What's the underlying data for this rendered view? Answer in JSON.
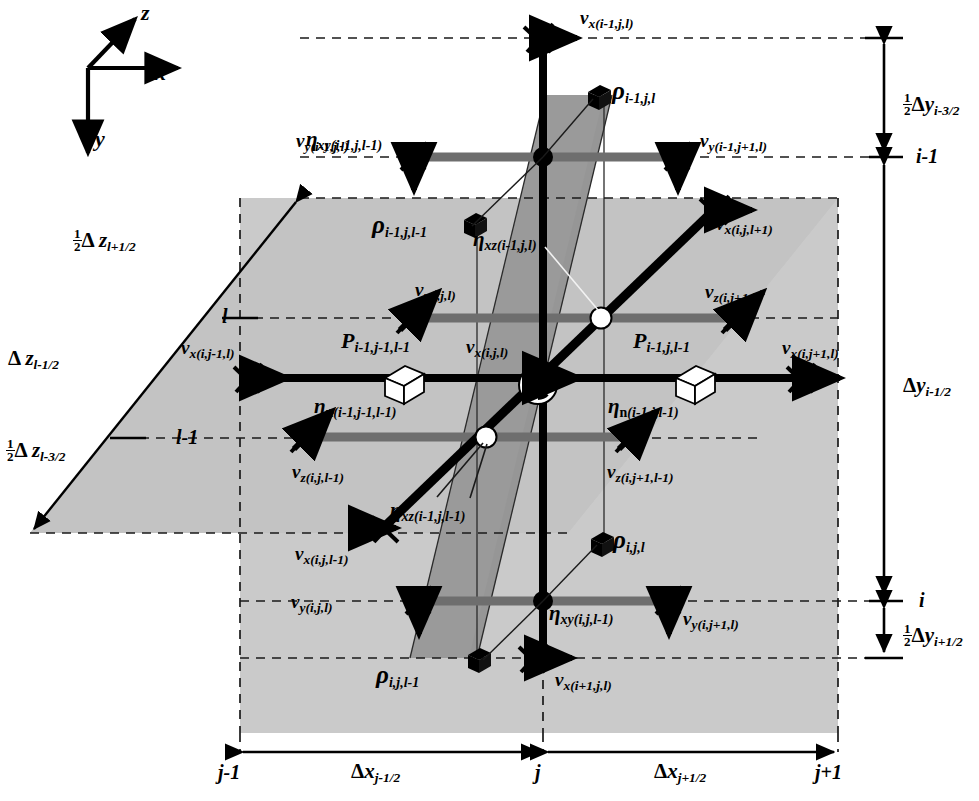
{
  "figure": {
    "kind": "staggered-grid-finite-difference-stencil",
    "colors": {
      "ink": "#000000",
      "plane_light": "#c3c3c3",
      "plane_dark": "#9a9a9a",
      "bar_gray": "#6e6e6e",
      "background": "#ffffff"
    }
  },
  "axes": {
    "z_label": "z",
    "x_label": "x",
    "y_label": "y"
  },
  "velocity_labels": [
    {
      "name": "vx-im1-j-l",
      "base": "v",
      "comp": "x",
      "idx": "(i-1,j,l)",
      "x": 580,
      "y": 8,
      "marker": "cross-arrow-right",
      "mx": 537,
      "my": 38
    },
    {
      "name": "vy-im1-j-l",
      "base": "v",
      "comp": "y",
      "idx": "(i-1,j,l)",
      "x": 296,
      "y": 131,
      "marker": "cross-arrow-down",
      "mx": 413,
      "my": 157
    },
    {
      "name": "vy-im1-jp1-l",
      "base": "v",
      "comp": "y",
      "idx": "(i-1,j+1,l)",
      "x": 700,
      "y": 131,
      "marker": "cross-arrow-down",
      "mx": 678,
      "my": 157
    },
    {
      "name": "vx-i-j-lp1",
      "base": "v",
      "comp": "x",
      "idx": "(i,j,l+1)",
      "x": 716,
      "y": 214,
      "marker": "cross-arrow-right",
      "mx": 713,
      "my": 209
    },
    {
      "name": "vz-i-j-l",
      "base": "v",
      "comp": "z",
      "idx": "(i,j,l)",
      "x": 415,
      "y": 280,
      "marker": "cross-arrow-ne",
      "mx": 409,
      "my": 320
    },
    {
      "name": "vz-i-jp1-l",
      "base": "v",
      "comp": "z",
      "idx": "(i,j+1,l)",
      "x": 705,
      "y": 282,
      "marker": "cross-arrow-ne",
      "mx": 734,
      "my": 319
    },
    {
      "name": "vx-i-jm1-l",
      "base": "v",
      "comp": "x",
      "idx": "(i,j-1,l)",
      "x": 181,
      "y": 338,
      "marker": "cross-arrow-right",
      "mx": 247,
      "my": 378
    },
    {
      "name": "vx-i-j-l",
      "base": "v",
      "comp": "x",
      "idx": "(i,j,l)",
      "x": 466,
      "y": 337,
      "marker": "center-pie",
      "mx": 538,
      "my": 385
    },
    {
      "name": "vx-i-jp1-l",
      "base": "v",
      "comp": "x",
      "idx": "(i,j+1,l)",
      "x": 782,
      "y": 338,
      "marker": "cross-arrow-right",
      "mx": 800,
      "my": 378
    },
    {
      "name": "vz-i-j-lm1",
      "base": "v",
      "comp": "z",
      "idx": "(i,j,l-1)",
      "x": 292,
      "y": 462,
      "marker": "cross-arrow-ne",
      "mx": 303,
      "my": 436
    },
    {
      "name": "vz-i-jp1-lm1",
      "base": "v",
      "comp": "z",
      "idx": "(i,j+1,l-1)",
      "x": 607,
      "y": 462,
      "marker": "cross-arrow-ne",
      "mx": 628,
      "my": 436
    },
    {
      "name": "vx-i-j-lm1",
      "base": "v",
      "comp": "x",
      "idx": "(i,j,l-1)",
      "x": 295,
      "y": 544,
      "marker": "cross-arrow-right",
      "mx": 383,
      "my": 528
    },
    {
      "name": "vy-i-j-l",
      "base": "v",
      "comp": "y",
      "idx": "(i,j,l)",
      "x": 291,
      "y": 592,
      "marker": "cross-arrow-down",
      "mx": 419,
      "my": 601
    },
    {
      "name": "vy-i-jp1-l",
      "base": "v",
      "comp": "y",
      "idx": "(i,j+1,l)",
      "x": 683,
      "y": 609,
      "marker": "cross-arrow-down",
      "mx": 669,
      "my": 601
    },
    {
      "name": "vx-ip1-j-l",
      "base": "v",
      "comp": "x",
      "idx": "(i+1,j,l)",
      "x": 555,
      "y": 670,
      "marker": "cross-arrow-right",
      "mx": 534,
      "my": 658
    }
  ],
  "eta_labels": [
    {
      "name": "eta-xy-im1-j-lm1",
      "base": "η",
      "comp": "xy",
      "idx": "(i-1,j,l-1)",
      "x": 306,
      "y": 129
    },
    {
      "name": "eta-xz-im1-j-l",
      "base": "η",
      "comp": "xz",
      "idx": "(i-1,j,l)",
      "x": 473,
      "y": 229
    },
    {
      "name": "eta-n-im1-jm1-lm1",
      "base": "η",
      "comp": "n",
      "idx": "(i-1,j-1,l-1)",
      "x": 314,
      "y": 396
    },
    {
      "name": "eta-n-im1-j-lm1",
      "base": "η",
      "comp": "n",
      "idx": "(i-1,j,l-1)",
      "x": 608,
      "y": 396
    },
    {
      "name": "eta-xz-im1-j-lm1",
      "base": "η",
      "comp": "xz",
      "idx": "(i-1,j,l-1)",
      "x": 390,
      "y": 500
    },
    {
      "name": "eta-xy-i-j-lm1",
      "base": "η",
      "comp": "xy",
      "idx": "(i,j,l-1)",
      "x": 549,
      "y": 603
    }
  ],
  "rho_labels": [
    {
      "name": "rho-im1-j-l",
      "base": "ρ",
      "idx": "i-1,j,l",
      "x": 612,
      "y": 78,
      "cube_x": 597,
      "cube_y": 95
    },
    {
      "name": "rho-im1-j-lm1",
      "base": "ρ",
      "idx": "i-1,j,l-1",
      "x": 372,
      "y": 212,
      "cube_x": 473,
      "cube_y": 223
    },
    {
      "name": "rho-i-j-l",
      "base": "ρ",
      "idx": "i,j,l",
      "x": 613,
      "y": 527,
      "cube_x": 600,
      "cube_y": 542
    },
    {
      "name": "rho-i-j-lm1",
      "base": "ρ",
      "idx": "i,j,l-1",
      "x": 376,
      "y": 662,
      "cube_x": 477,
      "cube_y": 658
    }
  ],
  "pressure_labels": [
    {
      "name": "P-im1-jm1-lm1",
      "base": "P",
      "idx": "i-1,j-1,l-1",
      "x": 341,
      "y": 330,
      "cube_x": 398,
      "cube_y": 375
    },
    {
      "name": "P-im1-j-lm1",
      "base": "P",
      "idx": "i-1,j,l-1",
      "x": 633,
      "y": 330,
      "cube_x": 689,
      "cube_y": 375
    }
  ],
  "z_dimension_labels": [
    {
      "name": "half-dz-lp1h",
      "frac": true,
      "num": "1",
      "den": "2",
      "delta": "Δ",
      "base": "z",
      "idx": "l+1/2",
      "x": 73,
      "y": 228
    },
    {
      "name": "dz-lm1h",
      "frac": false,
      "delta": "Δ",
      "base": "z",
      "idx": "l-1/2",
      "x": 8,
      "y": 348
    },
    {
      "name": "half-dz-lm3h",
      "frac": true,
      "num": "1",
      "den": "2",
      "delta": "Δ",
      "base": "z",
      "idx": "l-3/2",
      "x": 6,
      "y": 438
    }
  ],
  "y_dimension_labels": [
    {
      "name": "half-dy-im3h",
      "frac": true,
      "num": "1",
      "den": "2",
      "delta": "Δ",
      "base": "y",
      "idx": "i-3/2",
      "x": 903,
      "y": 92
    },
    {
      "name": "dy-im1h",
      "frac": false,
      "delta": "Δ",
      "base": "y",
      "idx": "i-1/2",
      "x": 903,
      "y": 375
    },
    {
      "name": "half-dy-ip1h",
      "frac": true,
      "num": "1",
      "den": "2",
      "delta": "Δ",
      "base": "y",
      "idx": "i+1/2",
      "x": 903,
      "y": 623
    }
  ],
  "x_dimension_labels": [
    {
      "name": "dx-jm1h",
      "delta": "Δ",
      "base": "x",
      "idx": "j-1/2",
      "x": 351,
      "y": 761
    },
    {
      "name": "dx-jp1h",
      "delta": "Δ",
      "base": "x",
      "idx": "j+1/2",
      "x": 654,
      "y": 761
    }
  ],
  "tick_labels": [
    {
      "name": "tick-l",
      "text": "l",
      "x": 222,
      "y": 306
    },
    {
      "name": "tick-lm1",
      "text": "l-1",
      "x": 176,
      "y": 427
    },
    {
      "name": "tick-im1",
      "text": "i-1",
      "x": 916,
      "y": 146
    },
    {
      "name": "tick-i",
      "text": "i",
      "x": 919,
      "y": 590
    },
    {
      "name": "tick-jm1",
      "text": "j-1",
      "x": 218,
      "y": 762
    },
    {
      "name": "tick-j",
      "text": "j",
      "x": 535,
      "y": 762
    },
    {
      "name": "tick-jp1",
      "text": "j+1",
      "x": 815,
      "y": 762
    }
  ]
}
